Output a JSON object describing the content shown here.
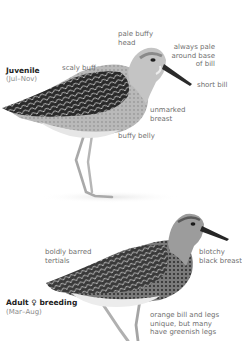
{
  "juvenile": {
    "title": "Juvenile",
    "season": "(Jul–Nov)",
    "annotations": {
      "scaly_buff": "scaly buff",
      "pale_buffy_head_1": "pale buffy",
      "pale_buffy_head_2": "head",
      "pale_base_1": "always pale",
      "pale_base_2": "around base",
      "pale_base_3": "of bill",
      "short_bill": "short bill",
      "unmarked_breast_1": "unmarked",
      "unmarked_breast_2": "breast",
      "buffy_belly": "buffy belly"
    }
  },
  "adult_female": {
    "title": "Adult ♀ breeding",
    "season": "(Mar–Aug)",
    "annotations": {
      "tertials_1": "boldly barred",
      "tertials_2": "tertials",
      "breast_1": "blotchy",
      "breast_2": "black breast",
      "legs_1": "orange bill and legs",
      "legs_2": "unique, but many",
      "legs_3": "have greenish legs"
    }
  },
  "colors": {
    "title_text": "#222222",
    "label_text": "#6f6f6f",
    "season_text": "#8a8a8a"
  }
}
